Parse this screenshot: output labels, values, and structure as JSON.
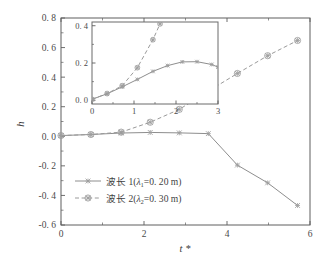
{
  "figure": {
    "background": "#ffffff",
    "line_color_series1": "#8e8e8e",
    "line_color_series2": "#9a9a9a",
    "axis_color": "#5f5f5f"
  },
  "chart_data": {
    "type": "line",
    "title": "",
    "xlabel": "t *",
    "ylabel": "h",
    "xlim": [
      0,
      6
    ],
    "ylim": [
      -0.6,
      0.8
    ],
    "grid": false,
    "legend_position": "inside-lower-left",
    "x_ticks": [
      "0",
      "2",
      "4",
      "6"
    ],
    "x_tick_values": [
      0,
      2,
      4,
      6
    ],
    "x_minor_tick_values": [
      1,
      3,
      5
    ],
    "y_ticks": [
      "0. 8",
      "0. 6",
      "0. 4",
      "0. 2",
      "0. 0",
      "-0. 2",
      "-0. 4",
      "-0. 6"
    ],
    "y_tick_values": [
      0.8,
      0.6,
      0.4,
      0.2,
      0.0,
      -0.2,
      -0.4,
      -0.6
    ],
    "y_minor_tick_values": [
      0.7,
      0.5,
      0.3,
      0.1,
      -0.1,
      -0.3,
      -0.5
    ],
    "series": [
      {
        "name": "波长 1(λ1=0. 20 m)",
        "label_main": "波长 1(",
        "label_lambda": "λ",
        "label_sub": "1",
        "label_tail": "=0. 20 m)",
        "linestyle": "solid",
        "marker": "star",
        "color": "#8e8e8e",
        "x": [
          0.0,
          0.72,
          1.45,
          2.15,
          2.85,
          3.55,
          4.25,
          4.98,
          5.7
        ],
        "y": [
          0.005,
          0.012,
          0.022,
          0.026,
          0.023,
          0.018,
          -0.195,
          -0.315,
          -0.468
        ]
      },
      {
        "name": "波长 2(λ2=0. 30 m)",
        "label_main": "波长 2(",
        "label_lambda": "λ",
        "label_sub": "2",
        "label_tail": "=0. 30 m)",
        "linestyle": "dashed",
        "marker": "circled-star",
        "color": "#9a9a9a",
        "x": [
          0.0,
          0.72,
          1.45,
          2.15,
          2.85,
          3.55,
          4.25,
          4.98,
          5.7
        ],
        "y": [
          0.005,
          0.012,
          0.028,
          0.095,
          0.182,
          0.305,
          0.425,
          0.545,
          0.648
        ]
      }
    ]
  },
  "inset": {
    "xlim": [
      0,
      3
    ],
    "ylim": [
      -0.02,
      0.42
    ],
    "xlabel": "",
    "ylabel": "",
    "x_ticks": [
      "0",
      "1",
      "2",
      "3"
    ],
    "x_tick_values": [
      0,
      1,
      2,
      3
    ],
    "x_minor_tick_values": [
      0.5,
      1.5,
      2.5
    ],
    "y_ticks": [
      "0. 4",
      "0. 2",
      "0. 0"
    ],
    "y_tick_values": [
      0.4,
      0.2,
      0.0
    ],
    "y_minor_tick_values": [
      0.3,
      0.1
    ],
    "series": [
      {
        "name": "波长 1",
        "linestyle": "solid",
        "marker": "star",
        "x": [
          0.0,
          0.36,
          0.72,
          1.08,
          1.45,
          1.8,
          2.15,
          2.5,
          2.85,
          3.0
        ],
        "y": [
          0.005,
          0.035,
          0.072,
          0.112,
          0.155,
          0.186,
          0.206,
          0.207,
          0.192,
          0.178
        ]
      },
      {
        "name": "波长 2",
        "linestyle": "dashed",
        "marker": "circled-star",
        "x": [
          0.0,
          0.36,
          0.72,
          1.08,
          1.45,
          1.62
        ],
        "y": [
          0.005,
          0.036,
          0.078,
          0.175,
          0.325,
          0.41
        ]
      }
    ]
  }
}
